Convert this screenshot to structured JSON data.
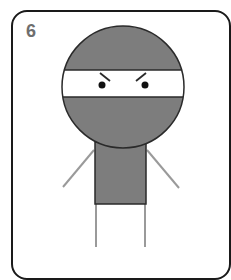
{
  "step": {
    "number": "6"
  },
  "illustration": {
    "subject": "ninja figure",
    "colors": {
      "suit": "#7d7d7d",
      "outline": "#2a2a2a",
      "band": "#ffffff",
      "limbs": "#9a9a9a",
      "eyes": "#111111",
      "number": "#6e6e6e",
      "frame": "#1a1a1a"
    }
  }
}
